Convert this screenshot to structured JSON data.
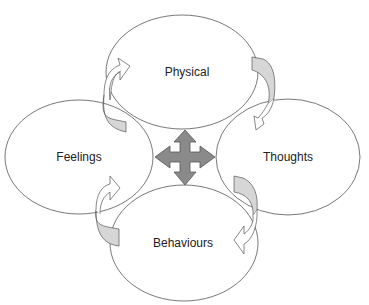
{
  "diagram": {
    "type": "five-areas cycle",
    "nodes": [
      {
        "id": "physical",
        "label": "Physical",
        "cx": 182,
        "cy": 72,
        "rx": 76,
        "ry": 57
      },
      {
        "id": "feelings",
        "label": "Feelings",
        "cx": 79,
        "cy": 157,
        "rx": 74,
        "ry": 57
      },
      {
        "id": "thoughts",
        "label": "Thoughts",
        "cx": 288,
        "cy": 157,
        "rx": 72,
        "ry": 58
      },
      {
        "id": "behaviours",
        "label": "Behaviours",
        "cx": 184,
        "cy": 243,
        "rx": 74,
        "ry": 58
      }
    ],
    "center_arrow": {
      "shape": "four-way-arrow",
      "cx": 185,
      "cy": 157
    },
    "connectors": [
      {
        "from": "feelings",
        "to": "physical",
        "style": "curved-arrow"
      },
      {
        "from": "physical",
        "to": "thoughts",
        "style": "curved-arrow"
      },
      {
        "from": "thoughts",
        "to": "behaviours",
        "style": "curved-arrow"
      },
      {
        "from": "behaviours",
        "to": "feelings",
        "style": "curved-arrow"
      }
    ],
    "colors": {
      "stroke": "#555555",
      "center_fill": "#8a8a8a",
      "ribbon_fill": "#d6d6d6",
      "background": "#ffffff"
    }
  }
}
